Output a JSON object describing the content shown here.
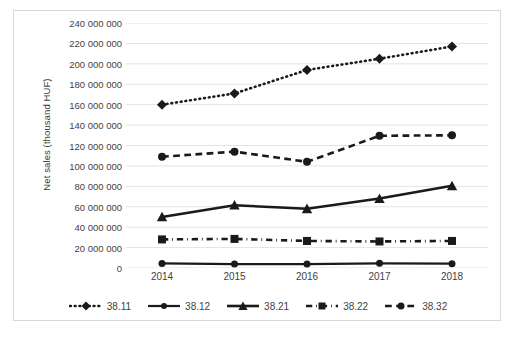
{
  "chart_data": {
    "type": "line",
    "title": "",
    "xlabel": "",
    "ylabel": "Net sales (thousand HUF)",
    "categories": [
      "2014",
      "2015",
      "2016",
      "2017",
      "2018"
    ],
    "x": [
      2014,
      2015,
      2016,
      2017,
      2018
    ],
    "ylim": [
      0,
      240000000
    ],
    "ytick_step": 20000000,
    "ytick_labels": [
      "240 000 000",
      "220 000 000",
      "200 000 000",
      "180 000 000",
      "160 000 000",
      "140 000 000",
      "120 000 000",
      "100 000 000",
      "80 000 000",
      "60 000 000",
      "40 000 000",
      "20 000 000",
      "0"
    ],
    "ytick_values": [
      240000000,
      220000000,
      200000000,
      180000000,
      160000000,
      140000000,
      120000000,
      100000000,
      80000000,
      60000000,
      40000000,
      20000000,
      0
    ],
    "grid": true,
    "grid_color": "#e3e3e3",
    "legend_position": "bottom",
    "series": [
      {
        "name": "38.11",
        "values": [
          160000000,
          171000000,
          194000000,
          205000000,
          217000000
        ],
        "color": "#1a1a1a",
        "line_style": "dotted",
        "marker": "diamond",
        "marker_size": 9,
        "line_width": 2.6
      },
      {
        "name": "38.12",
        "values": [
          4500000,
          3800000,
          3800000,
          4600000,
          4200000
        ],
        "color": "#1a1a1a",
        "line_style": "solid",
        "marker": "circle",
        "marker_size": 7,
        "line_width": 2.2
      },
      {
        "name": "38.21",
        "values": [
          50000000,
          61500000,
          58000000,
          68000000,
          80500000
        ],
        "color": "#1a1a1a",
        "line_style": "solid",
        "marker": "triangle",
        "marker_size": 9,
        "line_width": 2.6
      },
      {
        "name": "38.22",
        "values": [
          28000000,
          28500000,
          26500000,
          26000000,
          26500000
        ],
        "color": "#1a1a1a",
        "line_style": "dashdot",
        "marker": "square",
        "marker_size": 8,
        "line_width": 2.6
      },
      {
        "name": "38.32",
        "values": [
          109000000,
          114000000,
          104000000,
          129500000,
          130000000
        ],
        "color": "#1a1a1a",
        "line_style": "dashed",
        "marker": "circle",
        "marker_size": 8,
        "line_width": 2.6
      }
    ]
  },
  "axes": {
    "y_title": "Net sales (thousand HUF)"
  },
  "legend": {
    "items": [
      {
        "label": "38.11"
      },
      {
        "label": "38.12"
      },
      {
        "label": "38.21"
      },
      {
        "label": "38.22"
      },
      {
        "label": "38.32"
      }
    ]
  },
  "colors": {
    "series": "#1a1a1a",
    "grid": "#e3e3e3",
    "border": "#d9d9d9",
    "text": "#3f3f3f",
    "background": "#ffffff"
  }
}
